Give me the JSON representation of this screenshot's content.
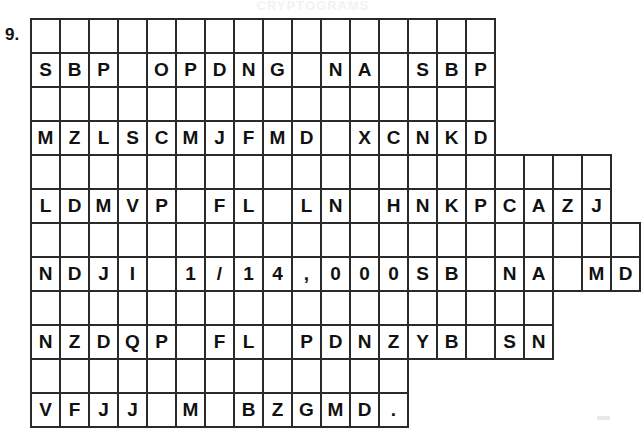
{
  "worksheet": {
    "header_remnant": "CRYPTOGRAMS",
    "item_number": "9.",
    "blank_symbol": "",
    "blocks": [
      {
        "name": "puzzle-line-1",
        "top": 18,
        "cell_count": 15,
        "answer_row": [
          "",
          "",
          "",
          "",
          "",
          "",
          "",
          "",
          "",
          "",
          "",
          "",
          "",
          "",
          ""
        ],
        "cipher_row": [
          "S",
          "B",
          "P",
          "",
          "O",
          "P",
          "D",
          "N",
          "G",
          "",
          "N",
          "A",
          "",
          "S",
          "B"
        ],
        "cipher_row_full": [
          "S",
          "B",
          "P",
          "",
          "O",
          "P",
          "D",
          "N",
          "G",
          "",
          "N",
          "A",
          "",
          "S",
          "B",
          "P"
        ]
      },
      {
        "name": "puzzle-line-2",
        "top": 86,
        "cell_count": 16,
        "cipher_row": [
          "M",
          "Z",
          "L",
          "S",
          "C",
          "M",
          "J",
          "F",
          "M",
          "D",
          "",
          "X",
          "C",
          "N",
          "K",
          "D"
        ]
      },
      {
        "name": "puzzle-line-3",
        "top": 154,
        "cell_count": 19,
        "cipher_row": [
          "L",
          "D",
          "M",
          "V",
          "P",
          "",
          "F",
          "L",
          "",
          "L",
          "N",
          "",
          "H",
          "N",
          "K",
          "P",
          "C",
          "A",
          "Z"
        ]
      },
      {
        "name": "puzzle-line-4",
        "top": 222,
        "cell_count": 20,
        "cipher_row": [
          "N",
          "D",
          "J",
          "I",
          "",
          "1",
          "/",
          "1",
          "4",
          ",",
          "0",
          "0",
          "0",
          "S",
          "B",
          "",
          "N",
          "A",
          "",
          "M"
        ]
      },
      {
        "name": "puzzle-line-5",
        "top": 290,
        "cell_count": 18,
        "cipher_row": [
          "N",
          "Z",
          "D",
          "Q",
          "P",
          "",
          "F",
          "L",
          "",
          "P",
          "D",
          "N",
          "Z",
          "Y",
          "B",
          "",
          "S",
          "N"
        ]
      },
      {
        "name": "puzzle-line-6",
        "top": 358,
        "cell_count": 13,
        "cipher_row": [
          "V",
          "F",
          "J",
          "J",
          "",
          "M",
          "",
          "B",
          "Z",
          "G",
          "M",
          "D",
          "."
        ]
      }
    ],
    "lines": [
      {
        "index": 1,
        "cells": [
          "S",
          "B",
          "P",
          "",
          "O",
          "P",
          "D",
          "N",
          "G",
          "",
          "N",
          "A",
          "",
          "S",
          "B",
          "P"
        ]
      },
      {
        "index": 2,
        "cells": [
          "M",
          "Z",
          "L",
          "S",
          "C",
          "M",
          "J",
          "F",
          "M",
          "D",
          "",
          "X",
          "C",
          "N",
          "K",
          "D"
        ]
      },
      {
        "index": 3,
        "cells": [
          "L",
          "D",
          "M",
          "V",
          "P",
          "",
          "F",
          "L",
          "",
          "L",
          "N",
          "",
          "H",
          "N",
          "K",
          "P",
          "C",
          "A",
          "Z",
          "J"
        ]
      },
      {
        "index": 4,
        "cells": [
          "N",
          "D",
          "J",
          "I",
          "",
          "1",
          "/",
          "1",
          "4",
          ",",
          "0",
          "0",
          "0",
          "S",
          "B",
          "",
          "N",
          "A",
          "",
          "M",
          "D"
        ]
      },
      {
        "index": 5,
        "cells": [
          "N",
          "Z",
          "D",
          "Q",
          "P",
          "",
          "F",
          "L",
          "",
          "P",
          "D",
          "N",
          "Z",
          "Y",
          "B",
          "",
          "S",
          "N"
        ]
      },
      {
        "index": 6,
        "cells": [
          "V",
          "F",
          "J",
          "J",
          "",
          "M",
          "",
          "B",
          "Z",
          "G",
          "M",
          "D",
          "."
        ]
      }
    ]
  }
}
